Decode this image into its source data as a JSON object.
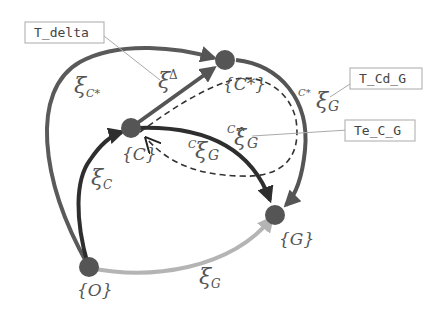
{
  "colors": {
    "background": "#ffffff",
    "xi_Cstar": "#5a5a5a",
    "xi_delta": "#555555",
    "xi_C": "#2e2e2e",
    "xi_G": "#b4b4b4",
    "C_xi_G": "#2e2e2e",
    "Cstar_xi_G": "#555555",
    "estimate_dashed": "#333333",
    "node": "#555555",
    "callout_line": "#aaaaaa",
    "callout_border": "#aaaaaa"
  },
  "nodes": [
    {
      "id": "O",
      "label": "{O}"
    },
    {
      "id": "C",
      "label": "{C}"
    },
    {
      "id": "Cstar",
      "label": "{C*}"
    },
    {
      "id": "G",
      "label": "{G}"
    }
  ],
  "edges": [
    {
      "id": "xi_Cstar",
      "from": "O",
      "to": "Cstar",
      "label_main": "ξ",
      "label_sub": "C*"
    },
    {
      "id": "xi_delta",
      "from": "C",
      "to": "Cstar",
      "label_main": "ξ",
      "label_sup": "Δ"
    },
    {
      "id": "xi_C",
      "from": "O",
      "to": "C",
      "label_main": "ξ",
      "label_sub": "C"
    },
    {
      "id": "xi_G",
      "from": "O",
      "to": "G",
      "label_main": "ξ",
      "label_sub": "G"
    },
    {
      "id": "C_xi_G",
      "from": "C",
      "to": "G",
      "label_pre": "C",
      "label_main": "ξ",
      "label_sub": "G"
    },
    {
      "id": "Cstar_xi_G",
      "from": "Cstar",
      "to": "G",
      "label_pre": "C*",
      "label_main": "ξ",
      "label_sub": "G"
    },
    {
      "id": "C_xihat_G",
      "from": "C",
      "to": "C",
      "style": "dashed",
      "label_pre": "C",
      "label_main": "ξ̂",
      "label_sub": "G"
    }
  ],
  "callouts": [
    {
      "id": "T_delta",
      "text": "T_delta"
    },
    {
      "id": "T_Cd_G",
      "text": "T_Cd_G"
    },
    {
      "id": "Te_C_G",
      "text": "Te_C_G"
    }
  ]
}
